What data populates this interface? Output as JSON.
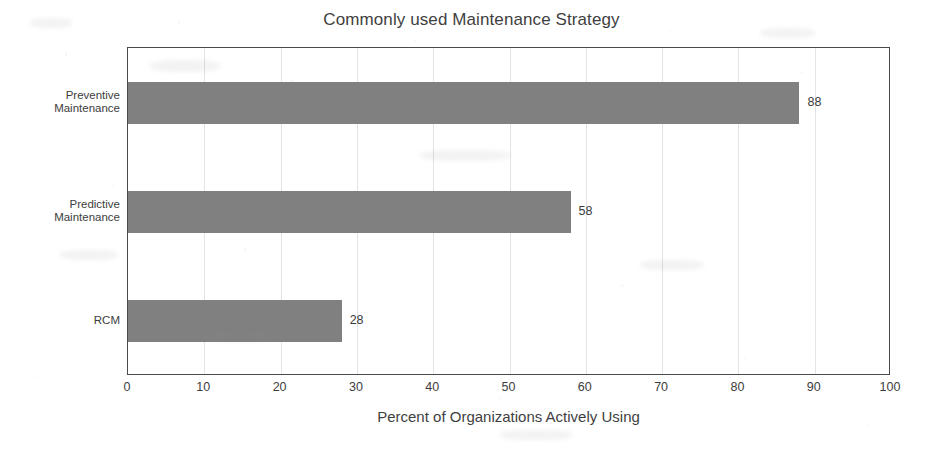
{
  "chart_data": {
    "type": "bar",
    "orientation": "horizontal",
    "title": "Commonly used Maintenance Strategy",
    "categories": [
      "Preventive\nMaintenance",
      "Predictive\nMaintenance",
      "RCM"
    ],
    "values": [
      88,
      58,
      28
    ],
    "data_labels": [
      "88",
      "58",
      "28"
    ],
    "xlabel": "Percent of Organizations Actively Using",
    "ylabel": "",
    "xlim": [
      0,
      100
    ],
    "xticks": [
      0,
      10,
      20,
      30,
      40,
      50,
      60,
      70,
      80,
      90,
      100
    ],
    "xtick_labels": [
      "0",
      "10",
      "20",
      "30",
      "40",
      "50",
      "60",
      "70",
      "80",
      "90",
      "100"
    ],
    "grid": "vertical-only",
    "legend": "none",
    "bar_color": "#808080",
    "plot_border_color": "#4a4a4a",
    "gridline_color": "#e3e3e3",
    "text_color": "#3d3d3d",
    "background_color": "#ffffff"
  }
}
